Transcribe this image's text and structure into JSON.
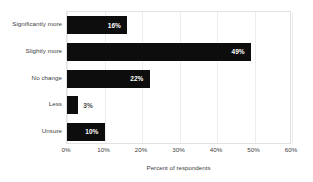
{
  "chart_data": {
    "type": "bar",
    "orientation": "horizontal",
    "title": "",
    "xlabel": "Percent of respondents",
    "ylabel": "",
    "categories": [
      "Significantly more",
      "Slightly more",
      "No change",
      "Less",
      "Unsure"
    ],
    "values": [
      16,
      49,
      22,
      3,
      10
    ],
    "value_labels": [
      "16%",
      "49%",
      "22%",
      "3%",
      "10%"
    ],
    "label_inside": [
      true,
      true,
      true,
      false,
      true
    ],
    "xlim": [
      0,
      60
    ],
    "xticks": [
      0,
      10,
      20,
      30,
      40,
      50,
      60
    ],
    "xtick_labels": [
      "0%",
      "10%",
      "20%",
      "30%",
      "40%",
      "50%",
      "60%"
    ],
    "grid": true,
    "legend": "none",
    "bar_color": "#0d0d0d",
    "background_color": "#ffffff",
    "grid_color": "#ededed",
    "frame_color": "#e2e2e2",
    "inside_label_color": "#ffffff",
    "outside_label_color": "#4a4a4a"
  }
}
